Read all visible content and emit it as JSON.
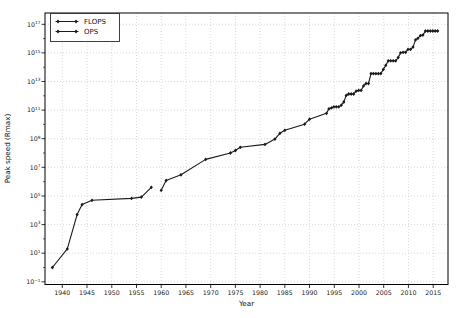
{
  "chart_data": {
    "type": "line",
    "title": "",
    "xlabel": "Year",
    "ylabel": "Peak speed (Rmax)",
    "marker": "thin-diamond",
    "grid": "dotted-major",
    "x_ticks": [
      1940,
      1945,
      1950,
      1955,
      1960,
      1965,
      1970,
      1975,
      1980,
      1985,
      1990,
      1995,
      2000,
      2005,
      2010,
      2015
    ],
    "y_tick_base": "10",
    "y_ticks_exponents": [
      -1,
      1,
      3,
      5,
      7,
      9,
      11,
      13,
      15,
      17
    ],
    "xlim": [
      1936.5,
      2018.0
    ],
    "ylim_exponents": [
      -1.19,
      17.79
    ],
    "legend": {
      "position": "upper-left"
    },
    "colors": {
      "line": "#1a1a1a",
      "grid": "#c8c8c8",
      "axis": "#000000",
      "text": "#1a1a1a",
      "background": "#ffffff"
    },
    "series": [
      {
        "name": "FLOPS",
        "points": [
          [
            1960,
            250000.0
          ],
          [
            1961,
            1200000.0
          ],
          [
            1964,
            3000000.0
          ],
          [
            1969,
            36000000.0
          ],
          [
            1974,
            100000000.0
          ],
          [
            1975,
            150000000.0
          ],
          [
            1976,
            250000000.0
          ],
          [
            1981,
            400000000.0
          ],
          [
            1983,
            941000000.0
          ],
          [
            1984,
            2400000000.0
          ],
          [
            1985,
            3900000000.0
          ],
          [
            1989,
            10300000000.0
          ],
          [
            1990,
            23200000000.0
          ],
          [
            1993.42,
            59700000000.0
          ],
          [
            1993.92,
            124000000000.0
          ],
          [
            1994.42,
            143400000000.0
          ],
          [
            1994.92,
            170400000000.0
          ],
          [
            1995.42,
            170400000000.0
          ],
          [
            1995.92,
            170400000000.0
          ],
          [
            1996.42,
            220400000000.0
          ],
          [
            1996.92,
            368200000000.0
          ],
          [
            1997.42,
            1068000000000.0
          ],
          [
            1997.92,
            1338000000000.0
          ],
          [
            1998.42,
            1338000000000.0
          ],
          [
            1998.92,
            1338000000000.0
          ],
          [
            1999.42,
            2121300000000.0
          ],
          [
            1999.92,
            2379600000000.0
          ],
          [
            2000.42,
            2379600000000.0
          ],
          [
            2000.92,
            4938000000000.0
          ],
          [
            2001.42,
            7226000000000.0
          ],
          [
            2001.92,
            7226000000000.0
          ],
          [
            2002.42,
            35860000000000.0
          ],
          [
            2002.92,
            35860000000000.0
          ],
          [
            2003.42,
            35860000000000.0
          ],
          [
            2003.92,
            35860000000000.0
          ],
          [
            2004.42,
            35860000000000.0
          ],
          [
            2004.92,
            70720000000000.0
          ],
          [
            2005.42,
            136800000000000.0
          ],
          [
            2005.92,
            280600000000000.0
          ],
          [
            2006.42,
            280600000000000.0
          ],
          [
            2006.92,
            280600000000000.0
          ],
          [
            2007.42,
            280600000000000.0
          ],
          [
            2007.92,
            478100000000000.0
          ],
          [
            2008.42,
            1026000000000000.0
          ],
          [
            2008.92,
            1105000000000000.0
          ],
          [
            2009.42,
            1105000000000000.0
          ],
          [
            2009.92,
            1759000000000000.0
          ],
          [
            2010.42,
            1759000000000000.0
          ],
          [
            2010.92,
            2566000000000000.0
          ],
          [
            2011.42,
            8162000000000000.0
          ],
          [
            2011.92,
            1.051e+16
          ],
          [
            2012.42,
            1.632e+16
          ],
          [
            2012.92,
            1.759e+16
          ],
          [
            2013.42,
            3.386e+16
          ],
          [
            2013.92,
            3.386e+16
          ],
          [
            2014.42,
            3.386e+16
          ],
          [
            2014.92,
            3.386e+16
          ],
          [
            2015.42,
            3.386e+16
          ],
          [
            2015.92,
            3.386e+16
          ]
        ]
      },
      {
        "name": "OPS",
        "points": [
          [
            1938,
            1
          ],
          [
            1941,
            20
          ],
          [
            1943,
            5000
          ],
          [
            1944,
            25000
          ],
          [
            1946,
            50000
          ],
          [
            1954,
            67000
          ],
          [
            1956,
            83000
          ],
          [
            1958,
            400000
          ]
        ]
      }
    ]
  }
}
